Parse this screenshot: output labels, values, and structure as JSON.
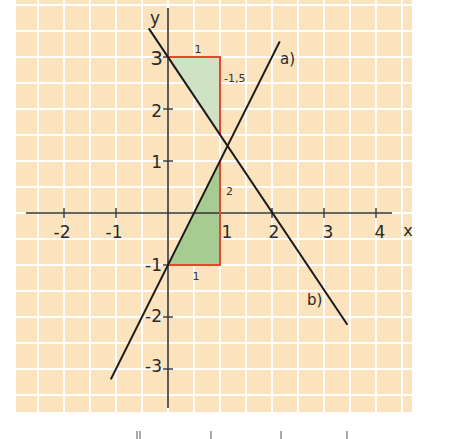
{
  "colors": {
    "background": "#fbe3bd",
    "grid": "#ffffff",
    "axis": "#333333",
    "line": "#1a1a1a",
    "triangle_stroke": "#e8452a",
    "triangle_fill_top": "#cfe3c4",
    "triangle_fill_bottom": "#a6cc92"
  },
  "axes": {
    "x_label": "x",
    "y_label": "y",
    "x_ticks": [
      "-2",
      "-1",
      "1",
      "2",
      "3",
      "4"
    ],
    "y_ticks": [
      "3",
      "2",
      "1",
      "-1",
      "-2",
      "-3"
    ]
  },
  "lines": [
    {
      "label": "a)",
      "equation": "y = 2x - 1",
      "from": [
        -1.1,
        -3.2
      ],
      "to": [
        2.15,
        3.3
      ]
    },
    {
      "label": "b)",
      "equation": "y = -1.5x + 3",
      "from": [
        -0.37,
        3.55
      ],
      "to": [
        3.45,
        -2.15
      ]
    }
  ],
  "slope_triangles": [
    {
      "line": "b)",
      "run_label": "1",
      "rise_label": "-1,5",
      "corner_points": [
        [
          0,
          3
        ],
        [
          1,
          3
        ],
        [
          1,
          1.5
        ]
      ]
    },
    {
      "line": "a)",
      "run_label": "1",
      "rise_label": "2",
      "corner_points": [
        [
          0,
          -1
        ],
        [
          1,
          -1
        ],
        [
          1,
          1
        ]
      ]
    }
  ],
  "chart_data": {
    "type": "line",
    "title": "",
    "xlabel": "x",
    "ylabel": "y",
    "xlim": [
      -2.9,
      4.7
    ],
    "ylim": [
      -3.8,
      4.1
    ],
    "grid": true,
    "series": [
      {
        "name": "a)",
        "equation": "y = 2x - 1",
        "x": [
          -1.1,
          2.15
        ],
        "y": [
          -3.2,
          3.3
        ]
      },
      {
        "name": "b)",
        "equation": "y = -1.5x + 3",
        "x": [
          -0.37,
          3.45
        ],
        "y": [
          3.55,
          -2.15
        ]
      }
    ],
    "annotations": [
      {
        "text": "1",
        "at": [
          0.5,
          3.2
        ]
      },
      {
        "text": "-1,5",
        "at": [
          1.3,
          2.6
        ]
      },
      {
        "text": "2",
        "at": [
          1.2,
          0.5
        ]
      },
      {
        "text": "1",
        "at": [
          0.5,
          -1.3
        ]
      }
    ],
    "intersection": [
      1.14,
      1.29
    ]
  }
}
